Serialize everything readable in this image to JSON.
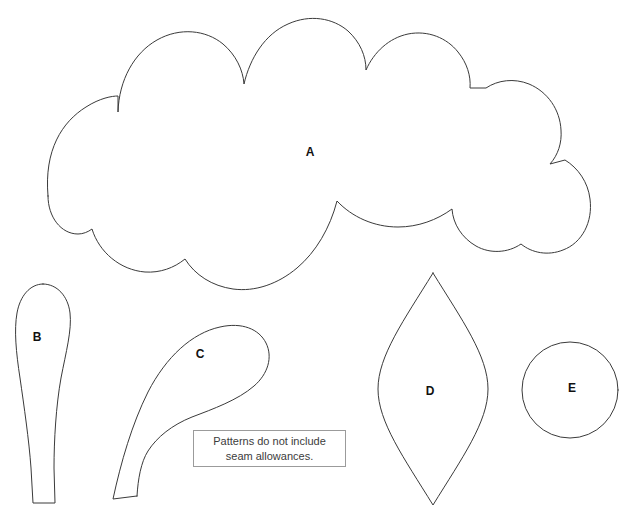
{
  "sheet": {
    "title": "Sewing Pattern Template Sheet",
    "background_color": "#ffffff",
    "stroke_color": "#3a3a3a",
    "label_color": "#111111",
    "width": 628,
    "height": 521
  },
  "pieces": [
    {
      "id": "A",
      "label": "A",
      "name": "cloud-body-piece",
      "description": "large scalloped cloud shaped body piece",
      "label_x": 310,
      "label_y": 153,
      "bounds": {
        "x": 35,
        "y": 18,
        "width": 560,
        "height": 282
      },
      "path": "M 48 196 C 44 150 62 122 86 107 C 100 98 112 96 118 96 L 118 112 C 119 80 134 53 157 40 C 180 27 206 30 223 44 C 236 55 243 70 244 84 C 250 58 265 34 288 24 C 310 14 333 18 348 31 C 360 42 366 56 366 70 C 374 52 389 38 408 34 C 428 30 447 38 458 52 C 467 63 471 76 470 88 L 486 88 C 498 80 514 78 529 84 C 548 92 560 110 561 130 C 562 143 558 155 550 164 L 565 160 C 578 168 588 182 590 199 C 593 222 582 243 563 250 C 548 256 532 253 521 244 C 508 253 490 254 476 246 C 462 238 453 224 452 209 C 437 220 418 227 398 227 C 374 227 352 217 337 201 C 330 228 316 252 297 268 C 278 284 255 292 233 289 C 212 286 195 275 185 259 C 174 268 160 273 145 272 C 120 270 99 252 92 229 C 88 232 83 234 78 234 C 61 234 48 217 48 196 Z"
    },
    {
      "id": "B",
      "label": "B",
      "name": "leg-piece",
      "description": "tapered leg piece with rounded top and flat bottom",
      "label_x": 37,
      "label_y": 338,
      "bounds": {
        "x": 14,
        "y": 283,
        "width": 61,
        "height": 220
      },
      "path": "M 43 284 C 57 284 68 296 70 313 C 72 330 66 352 61 378 C 56 406 54 440 54 468 L 55 503 L 33 503 L 31 468 C 29 440 24 406 20 378 C 16 352 14 330 17 313 C 20 296 30 284 43 284 Z"
    },
    {
      "id": "C",
      "label": "C",
      "name": "horn-tail-piece",
      "description": "curved hook shaped horn or tail piece",
      "label_x": 200,
      "label_y": 355,
      "bounds": {
        "x": 110,
        "y": 325,
        "width": 160,
        "height": 175
      },
      "path": "M 137 496 L 113 499 C 121 462 132 424 148 392 C 166 357 192 333 220 327 C 242 322 259 329 266 343 C 273 357 268 374 254 386 C 238 400 213 409 192 417 C 172 425 157 437 148 451 C 141 462 138 479 137 496 Z"
    },
    {
      "id": "D",
      "label": "D",
      "name": "ear-leaf-piece",
      "description": "pointed leaf shaped ear piece",
      "label_x": 430,
      "label_y": 392,
      "bounds": {
        "x": 378,
        "y": 273,
        "width": 110,
        "height": 232
      },
      "path": "M 433 273 C 462 320 488 356 488 389 C 488 422 462 458 433 505 C 404 458 378 422 378 389 C 378 356 404 320 433 273 Z"
    },
    {
      "id": "E",
      "label": "E",
      "name": "circle-piece",
      "description": "round circular piece",
      "label_x": 572,
      "label_y": 389,
      "bounds": {
        "x": 521,
        "y": 341,
        "width": 97,
        "height": 97
      },
      "circle": {
        "cx": 570,
        "cy": 390,
        "rx": 48,
        "ry": 48
      }
    }
  ],
  "note": {
    "line1": "Patterns do not include",
    "line2": "seam allowances.",
    "border_color": "#9b9b9b",
    "text_color": "#3c3c3c"
  }
}
